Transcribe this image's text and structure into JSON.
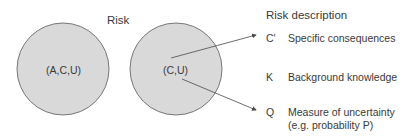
{
  "diagram": {
    "risk_label": "Risk",
    "left_circle": {
      "label": "(A,C,U)",
      "cx": 63,
      "cy": 69,
      "r": 46
    },
    "right_circle": {
      "label": "(C,U)",
      "cx": 176,
      "cy": 69,
      "r": 46
    },
    "colors": {
      "circle_fill": "#d9d9d9",
      "circle_stroke": "#5a5a5a",
      "text": "#3a3a3a",
      "arrow": "#4a4a4a"
    },
    "risk_description": {
      "title": "Risk description",
      "items": [
        {
          "symbol": "C′",
          "text": "Specific consequences"
        },
        {
          "symbol": "K",
          "text": "Background knowledge"
        },
        {
          "symbol": "Q",
          "text": "Measure of uncertainty",
          "subtext": "(e.g. probability P)"
        }
      ]
    }
  }
}
